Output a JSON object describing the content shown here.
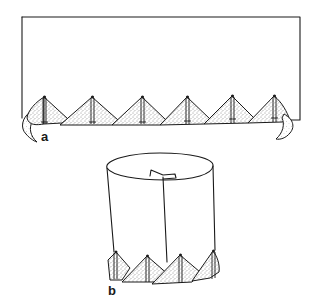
{
  "figure": {
    "panels": [
      {
        "id": "a",
        "label": "a",
        "description": "Flat rectangular strip with six stippled triangular flaps along the bottom edge and curled end flaps",
        "flap_count": 6
      },
      {
        "id": "b",
        "label": "b",
        "description": "Strip rolled into a cylinder joined with a tab seam, stippled triangular flaps around the base",
        "visible_flap_count": 4
      }
    ],
    "colors": {
      "line": "#1a1a1a",
      "background": "#ffffff",
      "stipple": "#2a2a2a"
    }
  }
}
